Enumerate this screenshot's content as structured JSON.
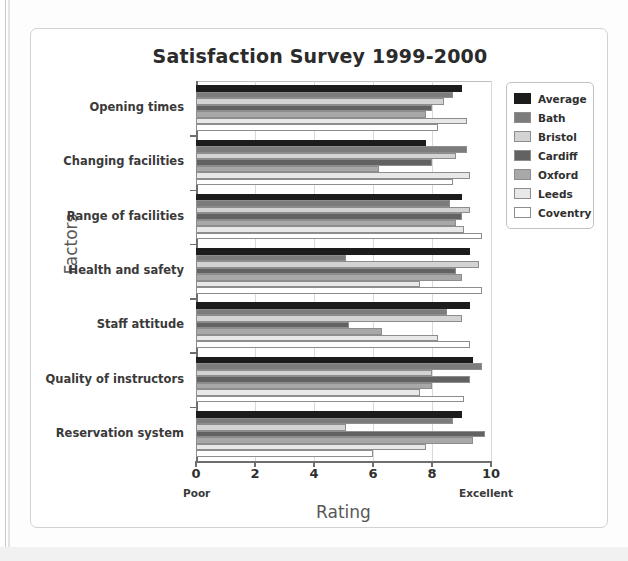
{
  "chart_data": {
    "type": "bar",
    "orientation": "horizontal",
    "title": "Satisfaction Survey 1999-2000",
    "xlabel": "Rating",
    "ylabel": "Factors",
    "xlim": [
      0,
      10
    ],
    "xticks": [
      0,
      2,
      4,
      6,
      8,
      10
    ],
    "xtick_labels": [
      "0",
      "2",
      "4",
      "6",
      "8",
      "10"
    ],
    "x_low_annotation": "Poor",
    "x_high_annotation": "Excellent",
    "grid": true,
    "legend_position": "right",
    "categories": [
      "Opening times",
      "Changing facilities",
      "Range of facilities",
      "Health and safety",
      "Staff attitude",
      "Quality of instructors",
      "Reservation system"
    ],
    "series": [
      {
        "name": "Average",
        "color": "#1c1c1c",
        "values": [
          9.0,
          7.8,
          9.0,
          9.3,
          9.3,
          9.4,
          9.0
        ]
      },
      {
        "name": "Bath",
        "color": "#7c7c7c",
        "values": [
          8.7,
          9.2,
          8.6,
          5.1,
          8.5,
          9.7,
          8.7
        ]
      },
      {
        "name": "Bristol",
        "color": "#d3d3d3",
        "values": [
          8.4,
          8.8,
          9.3,
          9.6,
          9.0,
          8.0,
          5.1
        ]
      },
      {
        "name": "Cardiff",
        "color": "#626262",
        "values": [
          8.0,
          8.0,
          9.0,
          8.8,
          5.2,
          9.3,
          9.8
        ]
      },
      {
        "name": "Oxford",
        "color": "#a8a8a8",
        "values": [
          7.8,
          6.2,
          8.8,
          9.0,
          6.3,
          8.0,
          9.4
        ]
      },
      {
        "name": "Leeds",
        "color": "#e8e8e8",
        "values": [
          9.2,
          9.3,
          9.1,
          7.6,
          8.2,
          7.6,
          7.8
        ]
      },
      {
        "name": "Coventry",
        "color": "#ffffff",
        "values": [
          8.2,
          8.7,
          9.7,
          9.7,
          9.3,
          9.1,
          6.0
        ]
      }
    ]
  }
}
